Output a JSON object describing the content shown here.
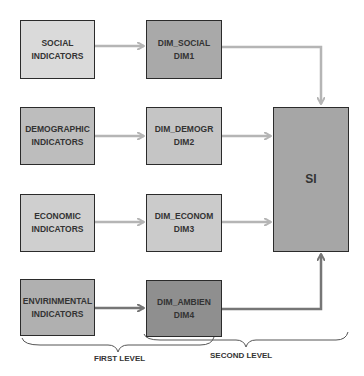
{
  "diagram": {
    "first_column": [
      {
        "line1": "SOCIAL",
        "line2": "INDICATORS",
        "fill": "#dadada"
      },
      {
        "line1": "DEMOGRAPHIC",
        "line2": "INDICATORS",
        "fill": "#bdbdbd"
      },
      {
        "line1": "ECONOMIC",
        "line2": "INDICATORS",
        "fill": "#cfcfcf"
      },
      {
        "line1": "ENVIRINMENTAL",
        "line2": "INDICATORS",
        "fill": "#b0b0b0"
      }
    ],
    "second_column": [
      {
        "line1": "DIM_SOCIAL",
        "line2": "DIM1",
        "fill": "#a9a9a9"
      },
      {
        "line1": "DIM_DEMOGR",
        "line2": "DIM2",
        "fill": "#c5c5c5"
      },
      {
        "line1": "DIM_ECONOM",
        "line2": "DIM3",
        "fill": "#cbcbcb"
      },
      {
        "line1": "DIM_AMBIEN",
        "line2": "DIM4",
        "fill": "#8f8f8f"
      }
    ],
    "result": {
      "label": "SI",
      "fill": "#a6a6a6"
    },
    "levels": {
      "first": "FIRST LEVEL",
      "second": "SECOND LEVEL"
    },
    "colors": {
      "arrow_light": "#b5b5b5",
      "arrow_dark": "#767676",
      "border": "#2b2b2b"
    }
  }
}
